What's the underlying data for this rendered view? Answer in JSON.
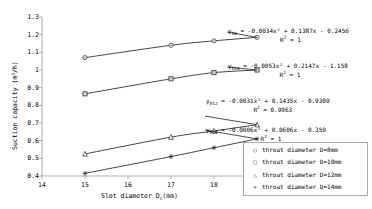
{
  "chart_data": {
    "type": "line",
    "title": "",
    "xlabel": "Slot diameter Ds(mm)",
    "ylabel": "Suction capacity (m3/h)",
    "xlim": [
      14,
      20
    ],
    "ylim": [
      0.4,
      1.3
    ],
    "grid": false,
    "legend_position": "bottom-right",
    "x": [
      15,
      17,
      18,
      19
    ],
    "xticks": [
      "14",
      "15",
      "16",
      "17",
      "18",
      "19",
      "20"
    ],
    "yticks": [
      "0.4",
      "0.5",
      "0.6",
      "0.7",
      "0.8",
      "0.9",
      "1",
      "1.1",
      "1.2",
      "1.3"
    ],
    "series": [
      {
        "name": "throat diameter D=8mm",
        "marker": "circle",
        "values": [
          1.07,
          1.14,
          1.165,
          1.185
        ]
      },
      {
        "name": "throat diameter D=10mm",
        "marker": "square",
        "values": [
          0.865,
          0.95,
          0.985,
          1.0
        ]
      },
      {
        "name": "throat diameter D=12mm",
        "marker": "triangle",
        "values": [
          0.525,
          0.62,
          0.655,
          0.69
        ]
      },
      {
        "name": "throat diameter D=14mm",
        "marker": "asterisk",
        "values": [
          0.415,
          0.51,
          0.56,
          0.61
        ]
      }
    ],
    "annotations": [
      {
        "series_label": "y",
        "series_sub": "D8",
        "equation": "= -0.0034x2 + 0.1387x - 0.2456",
        "equation_display": "= -0.0034x² + 0.1387x - 0.2456",
        "r2_label": "R2",
        "r2_value": "= 1"
      },
      {
        "series_label": "y",
        "series_sub": "D10",
        "equation": "= -0.0053x2 + 0.2147x - 1.158",
        "equation_display": "= -0.0053x² + 0.2147x - 1.158",
        "r2_label": "R2",
        "r2_value": "= 1"
      },
      {
        "series_label": "y",
        "series_sub": "D12",
        "equation": "= -0.0031x2 + 0.1435x - 0.9309",
        "equation_display": "= -0.0031x² + 0.1435x - 0.9309",
        "r2_label": "R2",
        "r2_value": "= 0.9963"
      },
      {
        "series_label": "y",
        "series_sub": "D14",
        "equation": "= -0.0006x2 + 0.0606x - 0.359",
        "equation_display": "= -0.0006x² + 0.0606x - 0.359",
        "r2_label": "R2",
        "r2_value": "= 1"
      }
    ]
  },
  "axes": {
    "y_title_main": "Suction capacity (m",
    "y_title_sup": "3",
    "y_title_tail": "/h)",
    "x_title_main": "Slot diameter D",
    "x_title_sub": "s",
    "x_title_tail": "(mm)"
  },
  "legend": {
    "items": [
      {
        "marker_glyph": "○",
        "label": "throat diameter D=8mm"
      },
      {
        "marker_glyph": "□",
        "label": "throat diameter D=10mm"
      },
      {
        "marker_glyph": "△",
        "label": "throat diameter D=12mm"
      },
      {
        "marker_glyph": "✳",
        "label": "throat diameter D=14mm"
      }
    ]
  },
  "colors": {
    "line": "#222222",
    "axis": "#999999",
    "text": "#000000",
    "legend_border": "#aaaaaa"
  }
}
